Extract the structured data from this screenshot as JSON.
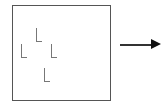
{
  "diagram": {
    "type": "visual-search-display",
    "box": {
      "shape": "square",
      "border_color": "#555555"
    },
    "items": [
      {
        "glyph": "L",
        "x": 36,
        "y": 28
      },
      {
        "glyph": "L",
        "x": 21,
        "y": 44
      },
      {
        "glyph": "L",
        "x": 51,
        "y": 44
      },
      {
        "glyph": "L",
        "x": 44,
        "y": 68
      }
    ],
    "arrow": {
      "direction": "right",
      "color": "#111111"
    }
  }
}
